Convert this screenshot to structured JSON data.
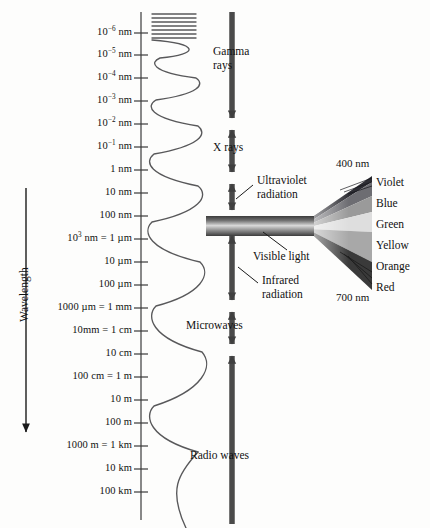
{
  "diagram": {
    "axis_title": "Wavelength",
    "axis_direction": "increasing-downward",
    "background_color": "#fdfdfc",
    "ink_color": "#1a1a1a",
    "bar_color": "#4a4a4a"
  },
  "wavelength_scale": {
    "ticks": [
      {
        "mantissa": "10",
        "exponent": "−6",
        "unit": " nm",
        "plain": "10⁻⁶ nm",
        "y": 33
      },
      {
        "mantissa": "10",
        "exponent": "−5",
        "unit": " nm",
        "plain": "10⁻⁵ nm",
        "y": 55
      },
      {
        "mantissa": "10",
        "exponent": "−4",
        "unit": " nm",
        "plain": "10⁻⁴ nm",
        "y": 78
      },
      {
        "mantissa": "10",
        "exponent": "−3",
        "unit": " nm",
        "plain": "10⁻³ nm",
        "y": 101
      },
      {
        "mantissa": "10",
        "exponent": "−2",
        "unit": " nm",
        "plain": "10⁻² nm",
        "y": 124
      },
      {
        "mantissa": "10",
        "exponent": "−1",
        "unit": " nm",
        "plain": "10⁻¹ nm",
        "y": 147
      },
      {
        "mantissa": "1",
        "exponent": "",
        "unit": " nm",
        "plain": "1 nm",
        "y": 170
      },
      {
        "mantissa": "10",
        "exponent": "",
        "unit": " nm",
        "plain": "10 nm",
        "y": 193
      },
      {
        "mantissa": "100",
        "exponent": "",
        "unit": " nm",
        "plain": "100 nm",
        "y": 216
      },
      {
        "mantissa": "10",
        "exponent": "3",
        "unit": " nm = 1 µm",
        "plain": "10³ nm = 1 µm",
        "y": 239
      },
      {
        "mantissa": "10",
        "exponent": "",
        "unit": " µm",
        "plain": "10 µm",
        "y": 262
      },
      {
        "mantissa": "100",
        "exponent": "",
        "unit": " µm",
        "plain": "100 µm",
        "y": 285
      },
      {
        "mantissa": "1000",
        "exponent": "",
        "unit": " µm = 1 mm",
        "plain": "1000 µm = 1 mm",
        "y": 308
      },
      {
        "mantissa": "10mm",
        "exponent": "",
        "unit": " = 1 cm",
        "plain": "10mm = 1 cm",
        "y": 331
      },
      {
        "mantissa": "10",
        "exponent": "",
        "unit": " cm",
        "plain": "10 cm",
        "y": 354
      },
      {
        "mantissa": "100",
        "exponent": "",
        "unit": " cm = 1 m",
        "plain": "100 cm = 1 m",
        "y": 377
      },
      {
        "mantissa": "10",
        "exponent": "",
        "unit": " m",
        "plain": "10 m",
        "y": 400
      },
      {
        "mantissa": "100",
        "exponent": "",
        "unit": " m",
        "plain": "100 m",
        "y": 423
      },
      {
        "mantissa": "1000",
        "exponent": "",
        "unit": " m = 1 km",
        "plain": "1000 m = 1 km",
        "y": 446
      },
      {
        "mantissa": "10",
        "exponent": "",
        "unit": " km",
        "plain": "10 km",
        "y": 469
      },
      {
        "mantissa": "100",
        "exponent": "",
        "unit": " km",
        "plain": "100 km",
        "y": 492
      }
    ]
  },
  "spectrum_bands": [
    {
      "name": "gamma-rays",
      "lines": [
        "Gamma",
        "rays"
      ],
      "x": 213,
      "y": 52
    },
    {
      "name": "x-rays",
      "lines": [
        "X rays"
      ],
      "x": 213,
      "y": 147
    },
    {
      "name": "ultraviolet-radiation",
      "lines": [
        "Ultraviolet",
        "radiation"
      ],
      "x": 257,
      "y": 179
    },
    {
      "name": "visible-light",
      "lines": [
        "Visible light"
      ],
      "x": 253,
      "y": 255
    },
    {
      "name": "infrared-radiation",
      "lines": [
        "Infrared",
        "radiation"
      ],
      "x": 262,
      "y": 279
    },
    {
      "name": "microwaves",
      "lines": [
        "Microwaves"
      ],
      "x": 186,
      "y": 325
    },
    {
      "name": "radio-waves",
      "lines": [
        "Radio waves"
      ],
      "x": 190,
      "y": 455
    }
  ],
  "visible_fan": {
    "top_label": "400 nm",
    "bottom_label": "700 nm",
    "colors": [
      {
        "name": "Violet",
        "tone": "#2e2e34"
      },
      {
        "name": "Blue",
        "tone": "#6d6d72"
      },
      {
        "name": "Green",
        "tone": "#9a9a9a"
      },
      {
        "name": "Yellow",
        "tone": "#dedede"
      },
      {
        "name": "Orange",
        "tone": "#a8a8a8"
      },
      {
        "name": "Red",
        "tone": "#3a3a3a"
      }
    ]
  }
}
